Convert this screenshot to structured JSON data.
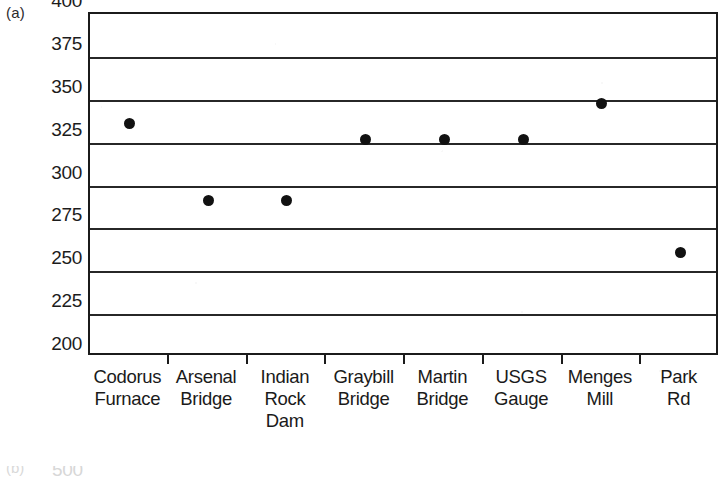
{
  "figure": {
    "panel_label": "(a)",
    "next_panel_label": "(b)",
    "next_panel_first_tick": "500"
  },
  "chart_data": {
    "type": "scatter",
    "title": "",
    "xlabel": "",
    "ylabel": "",
    "ylim": [
      200,
      400
    ],
    "ytick_step": 25,
    "yticks": [
      400,
      375,
      350,
      325,
      300,
      275,
      250,
      225,
      200
    ],
    "ytick_labels": [
      "400",
      "375",
      "350",
      "325",
      "300",
      "275",
      "250",
      "225",
      "200"
    ],
    "grid": true,
    "grid_axis": "y",
    "legend": false,
    "marker": "filled-circle",
    "marker_color": "#111111",
    "categories": [
      "Codorus Furnace",
      "Arsenal Bridge",
      "Indian Rock Dam",
      "Graybill Bridge",
      "Martin Bridge",
      "USGS Gauge",
      "Menges Mill",
      "Park Rd"
    ],
    "category_label_lines": [
      [
        "Codorus",
        "Furnace"
      ],
      [
        "Arsenal",
        "Bridge"
      ],
      [
        "Indian",
        "Rock",
        "Dam"
      ],
      [
        "Graybill",
        "Bridge"
      ],
      [
        "Martin",
        "Bridge"
      ],
      [
        "USGS",
        "Gauge"
      ],
      [
        "Menges",
        "Mill"
      ],
      [
        "Park",
        "Rd"
      ]
    ],
    "values": [
      336,
      291,
      291,
      327,
      327,
      327,
      348,
      261
    ]
  }
}
